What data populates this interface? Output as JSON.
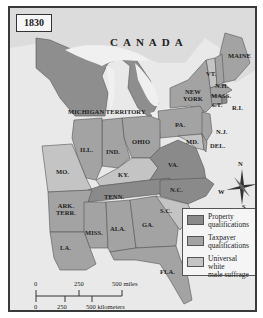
{
  "map": {
    "year_label": "1830",
    "region_label": "CANADA",
    "states": [
      {
        "id": "maine",
        "label": "MAINE",
        "category": "taxpayer"
      },
      {
        "id": "vermont",
        "label": "VT.",
        "category": "universal"
      },
      {
        "id": "new-hampshire",
        "label": "N.H.",
        "category": "taxpayer"
      },
      {
        "id": "massachusetts",
        "label": "MASS.",
        "category": "taxpayer"
      },
      {
        "id": "connecticut",
        "label": "CT.",
        "category": "taxpayer"
      },
      {
        "id": "rhode-island",
        "label": "R.I.",
        "category": "property"
      },
      {
        "id": "new-york",
        "label": "NEW YORK",
        "category": "taxpayer"
      },
      {
        "id": "new-jersey",
        "label": "N.J.",
        "category": "taxpayer"
      },
      {
        "id": "pennsylvania",
        "label": "PA.",
        "category": "taxpayer"
      },
      {
        "id": "delaware",
        "label": "DEL.",
        "category": "taxpayer"
      },
      {
        "id": "maryland",
        "label": "MD.",
        "category": "universal"
      },
      {
        "id": "virginia",
        "label": "VA.",
        "category": "property"
      },
      {
        "id": "north-carolina",
        "label": "N.C.",
        "category": "property"
      },
      {
        "id": "south-carolina",
        "label": "S.C.",
        "category": "universal"
      },
      {
        "id": "georgia",
        "label": "GA.",
        "category": "taxpayer"
      },
      {
        "id": "florida",
        "label": "FLA.",
        "category": "taxpayer"
      },
      {
        "id": "alabama",
        "label": "ALA.",
        "category": "taxpayer"
      },
      {
        "id": "mississippi",
        "label": "MISS.",
        "category": "taxpayer"
      },
      {
        "id": "louisiana",
        "label": "LA.",
        "category": "taxpayer"
      },
      {
        "id": "arkansas-territory",
        "label": "ARK. TERR.",
        "category": "taxpayer"
      },
      {
        "id": "tennessee",
        "label": "TENN.",
        "category": "property"
      },
      {
        "id": "kentucky",
        "label": "KY.",
        "category": "universal"
      },
      {
        "id": "ohio",
        "label": "OHIO",
        "category": "taxpayer"
      },
      {
        "id": "indiana",
        "label": "IND.",
        "category": "taxpayer"
      },
      {
        "id": "illinois",
        "label": "ILL.",
        "category": "taxpayer"
      },
      {
        "id": "missouri",
        "label": "MO.",
        "category": "universal"
      },
      {
        "id": "michigan-territory",
        "label": "MICHIGAN TERRITORY",
        "category": "taxpayer"
      }
    ]
  },
  "legend": {
    "items": [
      {
        "key": "property",
        "label": "Property qualifications",
        "line1": "Property",
        "line2": "qualifications",
        "color": "#8a8a8a"
      },
      {
        "key": "taxpayer",
        "label": "Taxpayer qualifications",
        "line1": "Taxpayer",
        "line2": "qualifications",
        "color": "#a3a3a3"
      },
      {
        "key": "universal",
        "label": "Universal white male suffrage",
        "line1": "Universal white",
        "line2": "male suffrage",
        "color": "#c4c4c4"
      }
    ]
  },
  "scale": {
    "miles": [
      "0",
      "250",
      "500 miles"
    ],
    "kilometers": [
      "0",
      "250",
      "500 kilometers"
    ]
  },
  "compass": {
    "n": "N",
    "s": "S",
    "e": "E",
    "w": "W"
  },
  "colors": {
    "water": "#ececec",
    "foreign_land": "#d9d9d9",
    "border": "#555555"
  }
}
